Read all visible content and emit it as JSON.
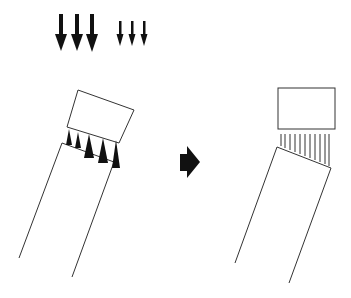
{
  "diagram": {
    "type": "process-illustration",
    "colors": {
      "stroke": "#333333",
      "fill": "#111111",
      "background": "#ffffff"
    },
    "legend_arrows": {
      "large": {
        "count": 3,
        "icon": "large-down-arrow-icon"
      },
      "small": {
        "count": 3,
        "icon": "small-down-arrow-icon"
      }
    },
    "left_panel": {
      "description": "Tilted block above tilted column, with force arrows of varying size pushing upward in the gap",
      "gap_arrows": 5
    },
    "transition": {
      "icon": "right-arrow-icon"
    },
    "right_panel": {
      "description": "Block straightened horizontally above tilted column, with uniform vertical lines in the gap",
      "gap_lines": 11
    }
  }
}
